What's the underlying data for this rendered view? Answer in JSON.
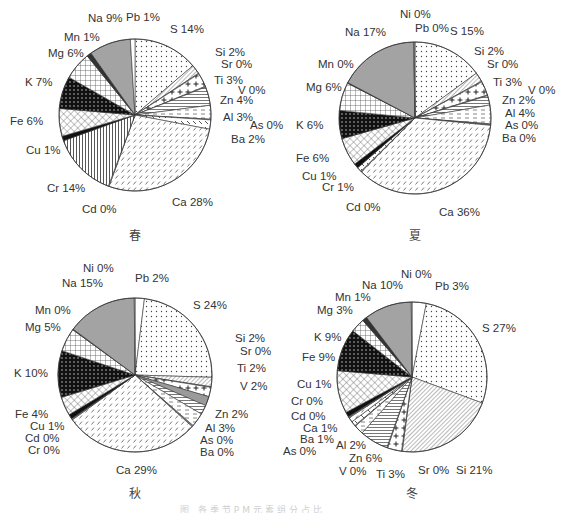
{
  "figure": {
    "caption": "图 各季节PM元素组分占比"
  },
  "chart_data": [
    {
      "type": "pie",
      "title": "春",
      "center": [
        135,
        115
      ],
      "radius": 76,
      "start_element": "S",
      "slices": [
        {
          "label": "S",
          "value": 14,
          "pattern": "dots"
        },
        {
          "label": "Si",
          "value": 2,
          "pattern": "diag"
        },
        {
          "label": "Sr",
          "value": 0,
          "pattern": "white"
        },
        {
          "label": "Ti",
          "value": 3,
          "pattern": "plus"
        },
        {
          "label": "V",
          "value": 0,
          "pattern": "white"
        },
        {
          "label": "Zn",
          "value": 4,
          "pattern": "hlines"
        },
        {
          "label": "Al",
          "value": 3,
          "pattern": "hdash"
        },
        {
          "label": "As",
          "value": 0,
          "pattern": "white"
        },
        {
          "label": "Ba",
          "value": 2,
          "pattern": "ddash"
        },
        {
          "label": "Ca",
          "value": 28,
          "pattern": "slash"
        },
        {
          "label": "Cd",
          "value": 0,
          "pattern": "white"
        },
        {
          "label": "Cr",
          "value": 14,
          "pattern": "vlines"
        },
        {
          "label": "Cu",
          "value": 1,
          "pattern": "black"
        },
        {
          "label": "Fe",
          "value": 6,
          "pattern": "diamond"
        },
        {
          "label": "K",
          "value": 7,
          "pattern": "blackdots"
        },
        {
          "label": "Mg",
          "value": 6,
          "pattern": "grid"
        },
        {
          "label": "Mn",
          "value": 1,
          "pattern": "dark"
        },
        {
          "label": "Na",
          "value": 9,
          "pattern": "gray"
        },
        {
          "label": "Pb",
          "value": 1,
          "pattern": "white"
        }
      ],
      "labels": [
        {
          "text": "Pb 1%",
          "x": 126,
          "y": 21
        },
        {
          "text": "S 14%",
          "x": 170,
          "y": 33
        },
        {
          "text": "Si 2%",
          "x": 215,
          "y": 56
        },
        {
          "text": "Sr 0%",
          "x": 221,
          "y": 68
        },
        {
          "text": "Ti 3%",
          "x": 214,
          "y": 84
        },
        {
          "text": "V 0%",
          "x": 238,
          "y": 94
        },
        {
          "text": "Zn 4%",
          "x": 220,
          "y": 104
        },
        {
          "text": "Al 3%",
          "x": 223,
          "y": 121
        },
        {
          "text": "As 0%",
          "x": 250,
          "y": 129
        },
        {
          "text": "Ba 2%",
          "x": 231,
          "y": 143
        },
        {
          "text": "Ca 28%",
          "x": 172,
          "y": 206
        },
        {
          "text": "Cd 0%",
          "x": 82,
          "y": 213
        },
        {
          "text": "Cr 14%",
          "x": 47,
          "y": 192
        },
        {
          "text": "Cu 1%",
          "x": 26,
          "y": 154
        },
        {
          "text": "Fe 6%",
          "x": 10,
          "y": 125
        },
        {
          "text": "K 7%",
          "x": 25,
          "y": 86
        },
        {
          "text": "Mg 6%",
          "x": 48,
          "y": 57
        },
        {
          "text": "Mn 1%",
          "x": 64,
          "y": 41
        },
        {
          "text": "Na 9%",
          "x": 88,
          "y": 22
        }
      ]
    },
    {
      "type": "pie",
      "title": "夏",
      "center": [
        415,
        118
      ],
      "radius": 76,
      "start_element": "S",
      "slices": [
        {
          "label": "S",
          "value": 15,
          "pattern": "dots"
        },
        {
          "label": "Si",
          "value": 2,
          "pattern": "diag"
        },
        {
          "label": "Sr",
          "value": 0,
          "pattern": "white"
        },
        {
          "label": "Ti",
          "value": 3,
          "pattern": "plus"
        },
        {
          "label": "V",
          "value": 0,
          "pattern": "white"
        },
        {
          "label": "Zn",
          "value": 2,
          "pattern": "hlines"
        },
        {
          "label": "Al",
          "value": 4,
          "pattern": "hdash"
        },
        {
          "label": "As",
          "value": 0,
          "pattern": "white"
        },
        {
          "label": "Ba",
          "value": 0,
          "pattern": "white"
        },
        {
          "label": "Ca",
          "value": 36,
          "pattern": "slash"
        },
        {
          "label": "Cd",
          "value": 0,
          "pattern": "white"
        },
        {
          "label": "Cr",
          "value": 1,
          "pattern": "ddash"
        },
        {
          "label": "Cu",
          "value": 1,
          "pattern": "black"
        },
        {
          "label": "Fe",
          "value": 6,
          "pattern": "diamond"
        },
        {
          "label": "K",
          "value": 6,
          "pattern": "blackdots"
        },
        {
          "label": "Mg",
          "value": 6,
          "pattern": "grid"
        },
        {
          "label": "Mn",
          "value": 0,
          "pattern": "dark"
        },
        {
          "label": "Na",
          "value": 17,
          "pattern": "gray"
        },
        {
          "label": "Ni",
          "value": 0,
          "pattern": "white"
        },
        {
          "label": "Pb",
          "value": 0,
          "pattern": "white"
        }
      ],
      "labels": [
        {
          "text": "Ni 0%",
          "x": 400,
          "y": 18
        },
        {
          "text": "Pb 0%",
          "x": 415,
          "y": 32
        },
        {
          "text": "S 15%",
          "x": 450,
          "y": 35
        },
        {
          "text": "Si 2%",
          "x": 474,
          "y": 55
        },
        {
          "text": "Sr 0%",
          "x": 487,
          "y": 68
        },
        {
          "text": "Ti 3%",
          "x": 493,
          "y": 86
        },
        {
          "text": "V 0%",
          "x": 528,
          "y": 94
        },
        {
          "text": "Zn 2%",
          "x": 502,
          "y": 104
        },
        {
          "text": "Al 4%",
          "x": 505,
          "y": 117
        },
        {
          "text": "As 0%",
          "x": 505,
          "y": 129
        },
        {
          "text": "Ba 0%",
          "x": 502,
          "y": 142
        },
        {
          "text": "Ca 36%",
          "x": 439,
          "y": 216
        },
        {
          "text": "Cd 0%",
          "x": 346,
          "y": 211
        },
        {
          "text": "Cr 1%",
          "x": 322,
          "y": 191
        },
        {
          "text": "Cu 1%",
          "x": 302,
          "y": 180
        },
        {
          "text": "Fe 6%",
          "x": 296,
          "y": 162
        },
        {
          "text": "K 6%",
          "x": 296,
          "y": 129
        },
        {
          "text": "Mg 6%",
          "x": 306,
          "y": 91
        },
        {
          "text": "Mn 0%",
          "x": 318,
          "y": 68
        },
        {
          "text": "Na 17%",
          "x": 345,
          "y": 36
        }
      ]
    },
    {
      "type": "pie",
      "title": "秋",
      "center": [
        135,
        375
      ],
      "radius": 77,
      "start_element": "Pb",
      "slices": [
        {
          "label": "Pb",
          "value": 2,
          "pattern": "white"
        },
        {
          "label": "S",
          "value": 24,
          "pattern": "dots"
        },
        {
          "label": "Si",
          "value": 2,
          "pattern": "diag"
        },
        {
          "label": "Sr",
          "value": 0,
          "pattern": "white"
        },
        {
          "label": "Ti",
          "value": 2,
          "pattern": "plus"
        },
        {
          "label": "V",
          "value": 2,
          "pattern": "midgray"
        },
        {
          "label": "Zn",
          "value": 2,
          "pattern": "hlines"
        },
        {
          "label": "Al",
          "value": 3,
          "pattern": "hdash"
        },
        {
          "label": "As",
          "value": 0,
          "pattern": "white"
        },
        {
          "label": "Ba",
          "value": 0,
          "pattern": "white"
        },
        {
          "label": "Ca",
          "value": 29,
          "pattern": "slash"
        },
        {
          "label": "Cd",
          "value": 0,
          "pattern": "white"
        },
        {
          "label": "Cr",
          "value": 0,
          "pattern": "white"
        },
        {
          "label": "Cu",
          "value": 1,
          "pattern": "black"
        },
        {
          "label": "Fe",
          "value": 4,
          "pattern": "diamond"
        },
        {
          "label": "K",
          "value": 10,
          "pattern": "blackdots"
        },
        {
          "label": "Mg",
          "value": 5,
          "pattern": "grid"
        },
        {
          "label": "Mn",
          "value": 0,
          "pattern": "dark"
        },
        {
          "label": "Na",
          "value": 15,
          "pattern": "gray"
        },
        {
          "label": "Ni",
          "value": 0,
          "pattern": "white"
        }
      ],
      "labels": [
        {
          "text": "Ni 0%",
          "x": 83,
          "y": 272
        },
        {
          "text": "Pb 2%",
          "x": 135,
          "y": 282
        },
        {
          "text": "Na 15%",
          "x": 62,
          "y": 287
        },
        {
          "text": "S 24%",
          "x": 193,
          "y": 309
        },
        {
          "text": "Mn 0%",
          "x": 35,
          "y": 314
        },
        {
          "text": "Mg 5%",
          "x": 25,
          "y": 331
        },
        {
          "text": "Si 2%",
          "x": 235,
          "y": 342
        },
        {
          "text": "Sr 0%",
          "x": 240,
          "y": 355
        },
        {
          "text": "K 10%",
          "x": 14,
          "y": 377
        },
        {
          "text": "Ti 2%",
          "x": 237,
          "y": 372
        },
        {
          "text": "V 2%",
          "x": 240,
          "y": 390
        },
        {
          "text": "Fe 4%",
          "x": 15,
          "y": 418
        },
        {
          "text": "Cu 1%",
          "x": 30,
          "y": 430
        },
        {
          "text": "Zn 2%",
          "x": 215,
          "y": 418
        },
        {
          "text": "Al 3%",
          "x": 205,
          "y": 432
        },
        {
          "text": "Cd 0%",
          "x": 25,
          "y": 442
        },
        {
          "text": "As 0%",
          "x": 200,
          "y": 444
        },
        {
          "text": "Cr 0%",
          "x": 28,
          "y": 454
        },
        {
          "text": "Ba 0%",
          "x": 200,
          "y": 456
        },
        {
          "text": "Ca 29%",
          "x": 116,
          "y": 474
        }
      ]
    },
    {
      "type": "pie",
      "title": "冬",
      "center": [
        412,
        377
      ],
      "radius": 75,
      "start_element": "Pb",
      "slices": [
        {
          "label": "Pb",
          "value": 3,
          "pattern": "white"
        },
        {
          "label": "S",
          "value": 27,
          "pattern": "dots"
        },
        {
          "label": "Si",
          "value": 21,
          "pattern": "diag"
        },
        {
          "label": "Sr",
          "value": 0,
          "pattern": "white"
        },
        {
          "label": "Ti",
          "value": 3,
          "pattern": "plus"
        },
        {
          "label": "V",
          "value": 0,
          "pattern": "white"
        },
        {
          "label": "Zn",
          "value": 6,
          "pattern": "hlines"
        },
        {
          "label": "Al",
          "value": 2,
          "pattern": "hdash"
        },
        {
          "label": "As",
          "value": 0,
          "pattern": "white"
        },
        {
          "label": "Ba",
          "value": 1,
          "pattern": "ddash"
        },
        {
          "label": "Ca",
          "value": 1,
          "pattern": "slash"
        },
        {
          "label": "Cd",
          "value": 0,
          "pattern": "white"
        },
        {
          "label": "Cr",
          "value": 0,
          "pattern": "white"
        },
        {
          "label": "Cu",
          "value": 1,
          "pattern": "black"
        },
        {
          "label": "Fe",
          "value": 9,
          "pattern": "diamond"
        },
        {
          "label": "K",
          "value": 9,
          "pattern": "blackdots"
        },
        {
          "label": "Mg",
          "value": 3,
          "pattern": "grid"
        },
        {
          "label": "Mn",
          "value": 1,
          "pattern": "dark"
        },
        {
          "label": "Na",
          "value": 10,
          "pattern": "gray"
        },
        {
          "label": "Ni",
          "value": 0,
          "pattern": "white"
        }
      ],
      "labels": [
        {
          "text": "Ni 0%",
          "x": 401,
          "y": 278
        },
        {
          "text": "Na 10%",
          "x": 362,
          "y": 289
        },
        {
          "text": "Pb 3%",
          "x": 435,
          "y": 290
        },
        {
          "text": "Mn 1%",
          "x": 335,
          "y": 301
        },
        {
          "text": "Mg 3%",
          "x": 317,
          "y": 314
        },
        {
          "text": "S 27%",
          "x": 482,
          "y": 332
        },
        {
          "text": "K 9%",
          "x": 314,
          "y": 341
        },
        {
          "text": "Fe 9%",
          "x": 302,
          "y": 361
        },
        {
          "text": "Cu 1%",
          "x": 297,
          "y": 388
        },
        {
          "text": "Cr 0%",
          "x": 291,
          "y": 405
        },
        {
          "text": "Cd 0%",
          "x": 291,
          "y": 420
        },
        {
          "text": "Ca 1%",
          "x": 303,
          "y": 432
        },
        {
          "text": "Ba 1%",
          "x": 300,
          "y": 443
        },
        {
          "text": "Al 2%",
          "x": 336,
          "y": 449
        },
        {
          "text": "As 0%",
          "x": 283,
          "y": 455
        },
        {
          "text": "Zn 6%",
          "x": 349,
          "y": 462
        },
        {
          "text": "V 0%",
          "x": 339,
          "y": 475
        },
        {
          "text": "Ti 3%",
          "x": 376,
          "y": 478
        },
        {
          "text": "Sr 0%",
          "x": 418,
          "y": 474
        },
        {
          "text": "Si 21%",
          "x": 456,
          "y": 474
        }
      ]
    }
  ]
}
